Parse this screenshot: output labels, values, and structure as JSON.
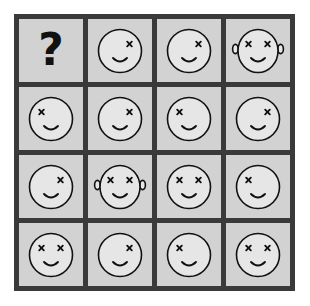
{
  "puzzle": {
    "title": "Raven-style progressive matrix",
    "rows": 4,
    "columns": 4,
    "colors": {
      "page_background": "#ffffff",
      "grid_line": "#3a3a3a",
      "cell_background": "#d2d2d2",
      "face_fill": "#e6e6e6",
      "ink": "#111111"
    },
    "missing_cell_symbol": "?",
    "cells": [
      {
        "id": "r1c1",
        "row": 1,
        "col": 1,
        "type": "question",
        "label": "?",
        "name": "missing-tile"
      },
      {
        "id": "r1c2",
        "row": 1,
        "col": 2,
        "type": "face",
        "left_eye": false,
        "right_eye": true,
        "ears": false,
        "mouth": "smile",
        "name": "face-right-eye"
      },
      {
        "id": "r1c3",
        "row": 1,
        "col": 3,
        "type": "face",
        "left_eye": false,
        "right_eye": true,
        "ears": false,
        "mouth": "smile",
        "name": "face-right-eye"
      },
      {
        "id": "r1c4",
        "row": 1,
        "col": 4,
        "type": "face",
        "left_eye": true,
        "right_eye": true,
        "ears": true,
        "mouth": "smile",
        "name": "face-both-eyes-ears"
      },
      {
        "id": "r2c1",
        "row": 2,
        "col": 1,
        "type": "face",
        "left_eye": true,
        "right_eye": false,
        "ears": false,
        "mouth": "smile",
        "name": "face-left-eye"
      },
      {
        "id": "r2c2",
        "row": 2,
        "col": 2,
        "type": "face",
        "left_eye": false,
        "right_eye": true,
        "ears": false,
        "mouth": "smile",
        "name": "face-right-eye"
      },
      {
        "id": "r2c3",
        "row": 2,
        "col": 3,
        "type": "face",
        "left_eye": true,
        "right_eye": false,
        "ears": false,
        "mouth": "smile",
        "name": "face-left-eye"
      },
      {
        "id": "r2c4",
        "row": 2,
        "col": 4,
        "type": "face",
        "left_eye": false,
        "right_eye": true,
        "ears": false,
        "mouth": "smile",
        "name": "face-right-eye"
      },
      {
        "id": "r3c1",
        "row": 3,
        "col": 1,
        "type": "face",
        "left_eye": false,
        "right_eye": true,
        "ears": false,
        "mouth": "smile",
        "name": "face-right-eye"
      },
      {
        "id": "r3c2",
        "row": 3,
        "col": 2,
        "type": "face",
        "left_eye": true,
        "right_eye": true,
        "ears": true,
        "mouth": "smile",
        "name": "face-both-eyes-ears"
      },
      {
        "id": "r3c3",
        "row": 3,
        "col": 3,
        "type": "face",
        "left_eye": true,
        "right_eye": true,
        "ears": false,
        "mouth": "smile",
        "name": "face-both-eyes"
      },
      {
        "id": "r3c4",
        "row": 3,
        "col": 4,
        "type": "face",
        "left_eye": true,
        "right_eye": false,
        "ears": false,
        "mouth": "smile",
        "name": "face-left-eye"
      },
      {
        "id": "r4c1",
        "row": 4,
        "col": 1,
        "type": "face",
        "left_eye": true,
        "right_eye": true,
        "ears": false,
        "mouth": "smile",
        "name": "face-both-eyes"
      },
      {
        "id": "r4c2",
        "row": 4,
        "col": 2,
        "type": "face",
        "left_eye": false,
        "right_eye": true,
        "ears": false,
        "mouth": "smile",
        "name": "face-right-eye"
      },
      {
        "id": "r4c3",
        "row": 4,
        "col": 3,
        "type": "face",
        "left_eye": true,
        "right_eye": false,
        "ears": false,
        "mouth": "smile",
        "name": "face-left-eye"
      },
      {
        "id": "r4c4",
        "row": 4,
        "col": 4,
        "type": "face",
        "left_eye": true,
        "right_eye": true,
        "ears": false,
        "mouth": "smile",
        "name": "face-both-eyes"
      }
    ]
  }
}
